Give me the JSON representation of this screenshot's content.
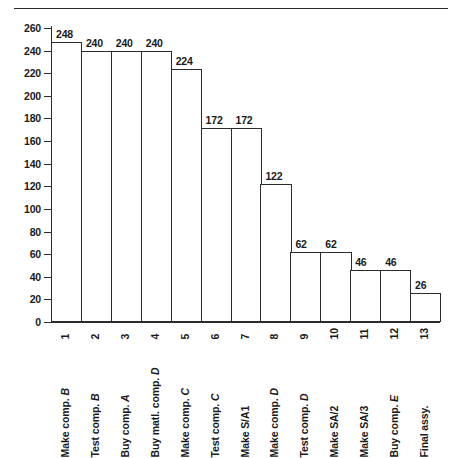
{
  "chart_data": {
    "type": "bar",
    "title": "",
    "subtitle": "",
    "xlabel": "",
    "ylabel": "",
    "ylim": [
      0,
      260
    ],
    "ytick_step": 20,
    "yticks": [
      0,
      20,
      40,
      60,
      80,
      100,
      120,
      140,
      160,
      180,
      200,
      220,
      240,
      260
    ],
    "grid": false,
    "legend": null,
    "bar_color": "#ffffff",
    "bar_edge_color": "#2b2b2b",
    "axis_color": "#2b2b2b",
    "categories": [
      "1",
      "2",
      "3",
      "4",
      "5",
      "6",
      "7",
      "8",
      "9",
      "10",
      "11",
      "12",
      "13"
    ],
    "category_labels": [
      "Make comp. B",
      "Test comp. B",
      "Buy comp. A",
      "Buy matl. comp. D",
      "Make comp. C",
      "Test comp. C",
      "Make S/A1",
      "Make comp. D",
      "Test comp. D",
      "Make SA/2",
      "Make SA/3",
      "Buy comp. E",
      "Final assy."
    ],
    "category_label_parts": [
      {
        "roman": "Make comp.",
        "italic": "B"
      },
      {
        "roman": "Test comp.",
        "italic": "B"
      },
      {
        "roman": "Buy comp.",
        "italic": "A"
      },
      {
        "roman": "Buy matl. comp.",
        "italic": "D"
      },
      {
        "roman": "Make comp.",
        "italic": "C"
      },
      {
        "roman": "Test comp.",
        "italic": "C"
      },
      {
        "roman": "Make S/A1",
        "italic": ""
      },
      {
        "roman": "Make comp.",
        "italic": "D"
      },
      {
        "roman": "Test comp.",
        "italic": "D"
      },
      {
        "roman": "Make SA/2",
        "italic": ""
      },
      {
        "roman": "Make SA/3",
        "italic": ""
      },
      {
        "roman": "Buy comp.",
        "italic": "E"
      },
      {
        "roman": "Final assy.",
        "italic": ""
      }
    ],
    "values": [
      248,
      240,
      240,
      240,
      224,
      172,
      172,
      122,
      62,
      62,
      46,
      46,
      26
    ],
    "value_labels": [
      "248",
      "240",
      "240",
      "240",
      "224",
      "172",
      "172",
      "122",
      "62",
      "62",
      "46",
      "46",
      "26"
    ]
  },
  "decor": {
    "top_rule": "horizontal-rule"
  }
}
